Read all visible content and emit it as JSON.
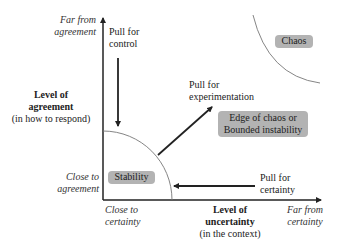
{
  "y_axis": {
    "far_label": [
      "Far from",
      "agreement"
    ],
    "title_lines": [
      "Level of",
      "agreement"
    ],
    "subtitle": "(in how to respond)",
    "near_label": [
      "Close to",
      "agreement"
    ]
  },
  "x_axis": {
    "near_label": [
      "Close to",
      "certainty"
    ],
    "title_lines": [
      "Level of",
      "uncertainty"
    ],
    "subtitle": "(in the context)",
    "far_label": [
      "Far from",
      "certainty"
    ]
  },
  "pulls": {
    "control": [
      "Pull for",
      "control"
    ],
    "experimentation": [
      "Pull for",
      "experimentation"
    ],
    "certainty": [
      "Pull for",
      "certainty"
    ]
  },
  "zones": {
    "stability": "Stability",
    "edge": [
      "Edge of chaos or",
      "Bounded instability"
    ],
    "chaos": "Chaos"
  },
  "colors": {
    "pill": "#b3b3b3",
    "axis": "#222222",
    "arc": "#777777"
  }
}
